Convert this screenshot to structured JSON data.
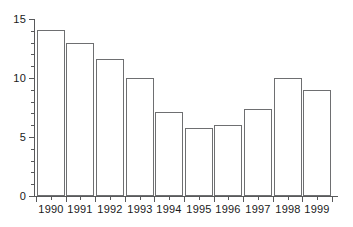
{
  "chart_data": {
    "type": "bar",
    "title": "",
    "subtitle": "",
    "xlabel": "",
    "ylabel": "",
    "categories": [
      "1990",
      "1991",
      "1992",
      "1993",
      "1994",
      "1995",
      "1996",
      "1997",
      "1998",
      "1999"
    ],
    "values": [
      14.1,
      13.0,
      11.6,
      10.0,
      7.1,
      5.8,
      6.0,
      7.4,
      10.0,
      9.0
    ],
    "ylim": [
      0,
      15
    ],
    "y_ticks": [
      0,
      5,
      10,
      15
    ],
    "y_tick_labels": [
      "0",
      "5",
      "10",
      "15"
    ],
    "y_minor_ticks": [
      1,
      2,
      3,
      4,
      6,
      7,
      8,
      9,
      11,
      12,
      13,
      14
    ],
    "x_tick_labels": [
      "1990",
      "1991",
      "1992",
      "1993",
      "1994",
      "1995",
      "1996",
      "1997",
      "1998",
      "1999"
    ],
    "grid": false,
    "legend": null,
    "legend_position": "none",
    "annotations": [],
    "series": [
      {
        "name": "",
        "values": [
          14.1,
          13.0,
          11.6,
          10.0,
          7.1,
          5.8,
          6.0,
          7.4,
          10.0,
          9.0
        ]
      }
    ],
    "style": {
      "bar_fill": "#ffffff",
      "bar_border": "#6e6f71",
      "axis_color": "#58595b",
      "text_color": "#1a1a1a",
      "background": "#ffffff"
    }
  }
}
